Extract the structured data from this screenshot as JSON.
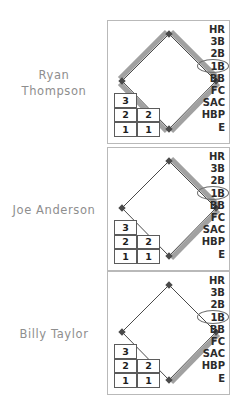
{
  "app": {
    "title": "Baseball Scorecard At-Bat Panels"
  },
  "outcome_options": [
    "HR",
    "3B",
    "2B",
    "1B",
    "BB",
    "FC",
    "SAC",
    "HBP",
    "E"
  ],
  "count_grid": {
    "columns": [
      "balls",
      "strikes"
    ],
    "left_column": [
      "3",
      "2",
      "1"
    ],
    "right_column": [
      "2",
      "1"
    ]
  },
  "colors": {
    "panel_border": "#b9b9b9",
    "diamond_outline": "#4a4a4a",
    "path_highlight": "#9c9c9c",
    "name_text": "#8e8e8e",
    "outcome_text": "#2b2b2b",
    "circle_marker": "#6d6d6d"
  },
  "panels": [
    {
      "player_name_line1": "Ryan",
      "player_name_line2": "Thompson",
      "selected_outcome": "1B",
      "bases_advanced": 4,
      "path_segments": [
        "home-to-first",
        "first-to-second",
        "second-to-third",
        "third-to-home"
      ],
      "count": {
        "balls": [
          "3",
          "2",
          "1"
        ],
        "strikes": [
          "2",
          "1"
        ]
      }
    },
    {
      "player_name_line1": "Joe Anderson",
      "player_name_line2": "",
      "selected_outcome": "1B",
      "bases_advanced": 2,
      "path_segments": [
        "home-to-first",
        "first-to-second"
      ],
      "count": {
        "balls": [
          "3",
          "2",
          "1"
        ],
        "strikes": [
          "2",
          "1"
        ]
      }
    },
    {
      "player_name_line1": "Billy Taylor",
      "player_name_line2": "",
      "selected_outcome": "1B",
      "bases_advanced": 1,
      "path_segments": [
        "home-to-first"
      ],
      "count": {
        "balls": [
          "3",
          "2",
          "1"
        ],
        "strikes": [
          "2",
          "1"
        ]
      }
    }
  ]
}
